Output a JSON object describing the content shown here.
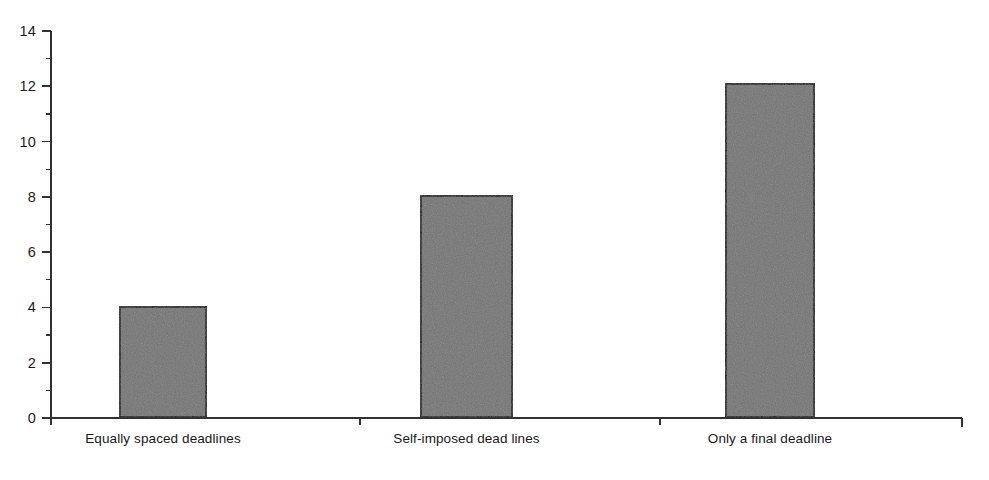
{
  "chart_data": {
    "type": "bar",
    "title": "",
    "subtitle": "",
    "xlabel": "",
    "ylabel": "",
    "categories": [
      "Equally spaced deadlines",
      "Self-imposed dead lines",
      "Only a final deadline"
    ],
    "values": [
      4,
      8,
      12
    ],
    "ylim": [
      0,
      14
    ],
    "y_major_ticks": [
      0,
      2,
      4,
      6,
      8,
      10,
      12,
      14
    ],
    "y_tick_labels": [
      "0",
      "2",
      "4",
      "6",
      "8",
      "10",
      "12",
      "14"
    ],
    "y_minor_ticks": [
      1,
      3,
      5,
      7,
      9,
      11,
      13
    ],
    "grid": false,
    "legend": null,
    "legend_position": "none",
    "annotations": [],
    "colors": {
      "bar_fill": "#737373",
      "bar_edge": "#111111",
      "axis": "#333333",
      "text": "#1a1a1a",
      "background": "#ffffff"
    }
  },
  "geometry": {
    "width": 989,
    "height": 480,
    "axis_x": 51,
    "axis_top_y": 31,
    "baseline_y": 418,
    "axis_right_x": 962,
    "major_tick_len": 9,
    "minor_tick_len": 5,
    "bars": [
      {
        "x": 119,
        "width": 88
      },
      {
        "x": 420,
        "width": 93
      },
      {
        "x": 725,
        "width": 90
      }
    ],
    "baseline_ticks_x": [
      360,
      660
    ],
    "label_y": 432,
    "bar_overshoot": [
      0.05,
      0.05,
      0.1
    ]
  }
}
